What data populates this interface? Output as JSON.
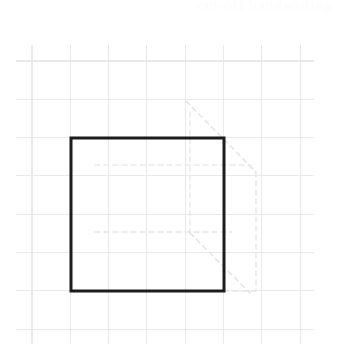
{
  "page": {
    "width": 347,
    "height": 345,
    "background_color": "#ffffff"
  },
  "annotation": {
    "top_right_faint_text": "cut-off handwriting",
    "color": "#fcfcfc"
  },
  "chart_data": {
    "type": "diagram",
    "xlabel": "",
    "ylabel": "",
    "grid": {
      "visible": true,
      "spacing_px": 38.3,
      "color": "#e9e9ea",
      "stroke_width": 1.1,
      "x_start": 32,
      "x_end": 300,
      "y_start": 61,
      "y_end": 330,
      "x_positions": [
        32,
        70.3,
        108.6,
        146.9,
        185.2,
        223.5,
        261.8,
        300.1
      ],
      "y_positions": [
        61,
        99.3,
        137.6,
        175.9,
        214.2,
        252.5,
        290.8,
        329.1
      ]
    },
    "shapes": [
      {
        "name": "main-square",
        "type": "rect",
        "x": 71,
        "y": 138,
        "width": 153,
        "height": 153,
        "stroke": "#1c1c1c",
        "stroke_width": 3,
        "fill": "none",
        "grid_cells": "4 x 4"
      }
    ],
    "ghost_lines": [
      {
        "name": "ghost-diagonal-upper-right",
        "type": "line",
        "x1": 186,
        "y1": 101,
        "x2": 256,
        "y2": 172,
        "stroke": "#e3e2e4",
        "stroke_width": 1.4
      },
      {
        "name": "ghost-vertical-right",
        "type": "line",
        "x1": 256,
        "y1": 172,
        "x2": 256,
        "y2": 291,
        "stroke": "#e6e5e7",
        "stroke_width": 1.4
      },
      {
        "name": "ghost-vertical-interior",
        "type": "line",
        "x1": 190,
        "y1": 112,
        "x2": 190,
        "y2": 236,
        "stroke": "#e8e7e9",
        "stroke_width": 1.3
      },
      {
        "name": "ghost-horizontal-upper",
        "type": "line",
        "x1": 95,
        "y1": 165,
        "x2": 251,
        "y2": 165,
        "stroke": "#eceaec",
        "stroke_width": 1.3
      },
      {
        "name": "ghost-horizontal-lower",
        "type": "line",
        "x1": 95,
        "y1": 232,
        "x2": 232,
        "y2": 232,
        "stroke": "#e5e4e6",
        "stroke_width": 1.3
      },
      {
        "name": "ghost-diagonal-lower",
        "type": "line",
        "x1": 190,
        "y1": 233,
        "x2": 250,
        "y2": 293,
        "stroke": "#e4e3e5",
        "stroke_width": 1.4
      },
      {
        "name": "ghost-horizontal-bottom-right",
        "type": "line",
        "x1": 224,
        "y1": 291,
        "x2": 258,
        "y2": 291,
        "stroke": "#e7e6e8",
        "stroke_width": 1.3
      }
    ]
  }
}
